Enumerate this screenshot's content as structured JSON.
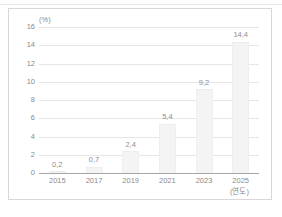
{
  "chart_data": {
    "type": "bar",
    "title": "",
    "subtitle": "",
    "categories": [
      "2015",
      "2017",
      "2019",
      "2021",
      "2023",
      "2025"
    ],
    "values": [
      0.2,
      0.7,
      2.4,
      5.4,
      9.2,
      14.4
    ],
    "value_labels": [
      "0,2",
      "0,7",
      "2,4",
      "5,4",
      "9,2",
      "14,4"
    ],
    "xlabel": "(연도)",
    "ylabel": "(%)",
    "ylim": [
      0,
      16
    ],
    "yticks": [
      16,
      14,
      12,
      10,
      8,
      6,
      4,
      2,
      0
    ],
    "ytick_labels": [
      "16",
      "14",
      "12",
      "10",
      "8",
      "6",
      "4",
      "2",
      "0"
    ],
    "grid": true,
    "legend": null,
    "series": [
      {
        "name": "",
        "values": [
          0.2,
          0.7,
          2.4,
          5.4,
          9.2,
          14.4
        ]
      }
    ]
  },
  "colors": {
    "bar_fill": "#f4f4f4",
    "bar_edge": "#ededed",
    "gridline": "#e6e6e6",
    "axis_line": "#a6a6a6",
    "text": "#8a8a8a",
    "frame": "#d8d8d8",
    "background": "#ffffff"
  }
}
